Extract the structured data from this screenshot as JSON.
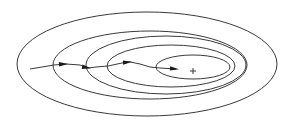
{
  "diagram": {
    "title": "",
    "stroke_color": "#3a3a3a",
    "background": "#ffffff",
    "contours": [
      {
        "cx": 147,
        "cy": 64,
        "rx": 130,
        "ry": 52
      },
      {
        "cx": 150,
        "cy": 65,
        "rx": 97,
        "ry": 34
      },
      {
        "cx": 166,
        "cy": 65,
        "rx": 80,
        "ry": 29
      },
      {
        "cx": 171,
        "cy": 66,
        "rx": 64,
        "ry": 21
      },
      {
        "cx": 193,
        "cy": 67,
        "rx": 37,
        "ry": 12
      }
    ],
    "minimum_marker": {
      "x": 193,
      "y": 71,
      "symbol": "+"
    },
    "path": {
      "points": [
        [
          30,
          69
        ],
        [
          54,
          65
        ],
        [
          66,
          64
        ],
        [
          80,
          65
        ],
        [
          88,
          68
        ],
        [
          96,
          67
        ],
        [
          108,
          66
        ],
        [
          122,
          63
        ],
        [
          130,
          62
        ],
        [
          140,
          64
        ],
        [
          150,
          67
        ],
        [
          160,
          68
        ],
        [
          176,
          69
        ]
      ],
      "arrows": [
        {
          "x": 66,
          "y": 64,
          "angle": -2
        },
        {
          "x": 89,
          "y": 68,
          "angle": 10
        },
        {
          "x": 130,
          "y": 62,
          "angle": -5
        },
        {
          "x": 177,
          "y": 69,
          "angle": 5
        }
      ]
    }
  }
}
